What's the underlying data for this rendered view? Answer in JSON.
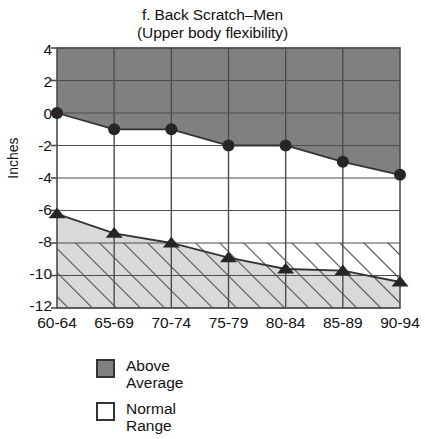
{
  "chart_data": {
    "type": "area",
    "title": "f. Back Scratch–Men",
    "subtitle": "(Upper body flexibility)",
    "xlabel": "",
    "ylabel": "Inches",
    "categories": [
      "60-64",
      "65-69",
      "70-74",
      "75-79",
      "80-84",
      "85-89",
      "90-94"
    ],
    "ylim": [
      -12,
      4
    ],
    "yticks": [
      4,
      2,
      0,
      -2,
      -4,
      -6,
      -8,
      -10,
      -12
    ],
    "grid": true,
    "legend_position": "below-left",
    "series": [
      {
        "name": "Above Average",
        "role": "upper-boundary",
        "marker": "circle",
        "values": [
          0,
          -1,
          -1,
          -2,
          -2,
          -3,
          -3.8
        ]
      },
      {
        "name": "Normal Range",
        "role": "lower-boundary",
        "marker": "triangle",
        "values": [
          -6.2,
          -7.4,
          -8.0,
          -8.9,
          -9.6,
          -9.7,
          -10.4
        ]
      }
    ],
    "bands": [
      {
        "label": "Above Average",
        "fill": "#808080",
        "region": "above upper-boundary line to top of axis"
      },
      {
        "label": "Normal Range",
        "fill": "#ffffff",
        "region": "between upper-boundary and lower-boundary lines"
      },
      {
        "label": "Below Normal",
        "fill": "#d9d9d9",
        "hatch": "diagonal",
        "region": "below lower-boundary line"
      }
    ]
  },
  "legend": {
    "items": [
      {
        "label_line1": "Above",
        "label_line2": "Average",
        "swatch": "filled-gray",
        "color": "#808080"
      },
      {
        "label_line1": "Normal",
        "label_line2": "Range",
        "swatch": "empty-white",
        "color": "#ffffff"
      }
    ]
  },
  "colors": {
    "above_average_fill": "#808080",
    "below_normal_fill": "#d9d9d9",
    "line": "#333333",
    "grid": "#4d4d4d",
    "text": "#121212"
  }
}
